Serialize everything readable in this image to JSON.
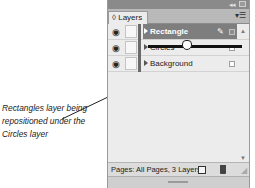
{
  "annotation": {
    "caption": "Rectangles layer being repositioned under the Circles layer"
  },
  "panel": {
    "title_bar": {
      "collapse_icon": "double-arrow-icon",
      "close_icon": "close-icon"
    },
    "tab": {
      "label": "◊ Layers"
    },
    "menu_icon": "panel-menu-icon",
    "layers": [
      {
        "name": "Rectangle",
        "selected": true,
        "visible": true,
        "icon_eye": "👁"
      },
      {
        "name": "Circles",
        "selected": false,
        "visible": true,
        "icon_eye": "👁"
      },
      {
        "name": "Background",
        "selected": false,
        "visible": true,
        "icon_eye": "👁"
      }
    ],
    "footer": {
      "status": "Pages: All Pages, 3 Layers",
      "new_layer_icon": "new-layer-icon",
      "delete_icon": "trash-icon"
    },
    "colors": {
      "selected_row": "#7e7e7e",
      "title_bar": "#8a8a8a",
      "tab_row": "#b9b9b9",
      "panel_bg": "#ececec",
      "drop_indicator": "#111111"
    }
  }
}
